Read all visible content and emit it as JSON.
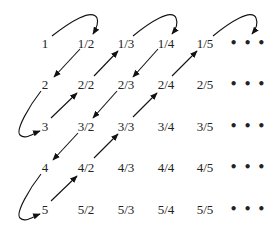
{
  "diagram": {
    "rows": [
      [
        "1",
        "1/2",
        "1/3",
        "1/4",
        "1/5",
        "• • •"
      ],
      [
        "2",
        "2/2",
        "2/3",
        "2/4",
        "2/5",
        "• • •"
      ],
      [
        "3",
        "3/2",
        "3/3",
        "3/4",
        "3/5",
        "• • •"
      ],
      [
        "4",
        "4/2",
        "4/3",
        "4/4",
        "4/5",
        "• • •"
      ],
      [
        "5",
        "5/2",
        "5/3",
        "5/4",
        "5/5",
        "• • •"
      ]
    ],
    "path_order": [
      "1",
      "1/2",
      "2",
      "3",
      "2/2",
      "1/3",
      "1/4",
      "2/3",
      "3/2",
      "4",
      "5",
      "4/2",
      "3/3",
      "2/4",
      "1/5",
      "..."
    ],
    "colors": {
      "text": "#222222",
      "arrow": "#111111",
      "background": "#ffffff"
    }
  }
}
